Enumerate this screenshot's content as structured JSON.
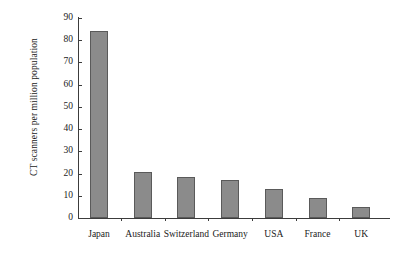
{
  "chart_data": {
    "type": "bar",
    "title": "",
    "subtitle": "",
    "xlabel": "",
    "ylabel": "CT scanners per million population",
    "categories": [
      "Japan",
      "Australia",
      "Switzerland",
      "Germany",
      "USA",
      "France",
      "UK"
    ],
    "values": [
      84,
      20.5,
      18.5,
      17,
      13,
      9,
      5
    ],
    "series": [
      {
        "name": "CT scanners per million population",
        "values": [
          84,
          20.5,
          18.5,
          17,
          13,
          9,
          5
        ]
      }
    ],
    "ylim": [
      0,
      90
    ],
    "yticks": [
      0,
      10,
      20,
      30,
      40,
      50,
      60,
      70,
      80,
      90
    ],
    "ytick_labels": [
      "0",
      "10",
      "20",
      "30",
      "40",
      "50",
      "60",
      "70",
      "80",
      "90"
    ],
    "grid": false,
    "legend": false,
    "legend_position": "none",
    "bar_color": "#8b8b8b",
    "bar_edge_color": "#5a5a5a",
    "axis_color": "#3c3c3c",
    "background_color": "#ffffff"
  }
}
